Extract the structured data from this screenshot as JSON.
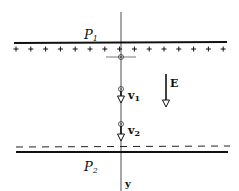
{
  "diagram": {
    "plates": {
      "top": {
        "label": "P",
        "sub": "1",
        "charge": "+"
      },
      "bottom": {
        "label": "P",
        "sub": "2",
        "charge": "-"
      }
    },
    "field": {
      "label": "E",
      "direction": "down"
    },
    "velocities": [
      {
        "label": "v",
        "sub": "1"
      },
      {
        "label": "v",
        "sub": "2"
      }
    ],
    "axis": {
      "label": "y"
    },
    "colors": {
      "ink": "#111111",
      "background": "#ffffff"
    }
  }
}
